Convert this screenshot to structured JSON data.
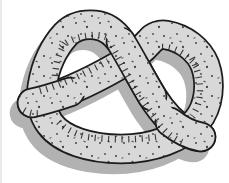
{
  "image": {
    "alt": "Cartoon illustration of a twisted salted pretzel with a gray drop shadow on a white background"
  },
  "colors": {
    "background": "#ffffff",
    "dough": "#d8d8d8",
    "outline": "#1c1c1c",
    "shadow": "#b2b2b2",
    "speckle": "#454545",
    "edge": "#e7e9ea"
  }
}
